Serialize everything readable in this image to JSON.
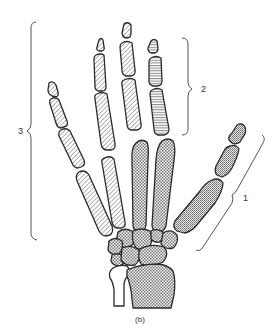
{
  "figure": {
    "caption": "(b)",
    "colors": {
      "background": "#ffffff",
      "outline": "#2a2a2a",
      "brace": "#555555"
    },
    "fills": {
      "diagonal_hatch": "phalanges of digits 2-5 (group 3)",
      "horizontal_hatch": "phalanges of middle digit region (group 2)",
      "fine_crosshatch": "thumb bones (group 1)",
      "checker_crosshatch": "metacarpals, carpals, radius and ulna"
    },
    "labels": [
      {
        "id": "group-1",
        "text": "1"
      },
      {
        "id": "group-2",
        "text": "2"
      },
      {
        "id": "group-3",
        "text": "3"
      }
    ]
  }
}
